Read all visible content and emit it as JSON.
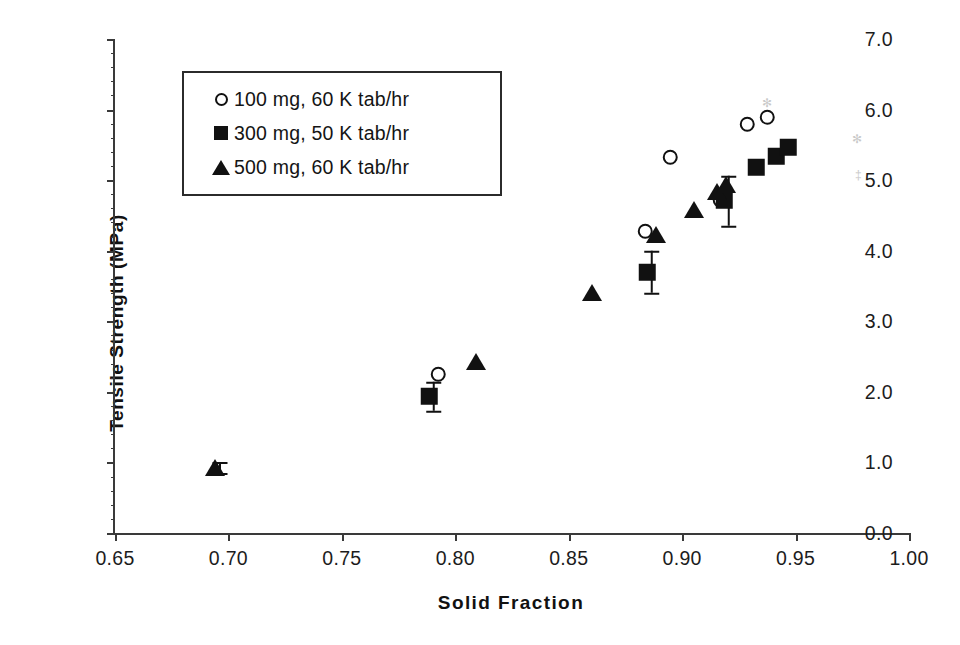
{
  "chart_data": {
    "type": "scatter",
    "title": "",
    "xlabel": "Solid Fraction",
    "ylabel": "Tensile Strength (MPa)",
    "xlim": [
      0.65,
      1.0
    ],
    "ylim": [
      0.0,
      7.0
    ],
    "xticks": [
      "0.65",
      "0.70",
      "0.75",
      "0.80",
      "0.85",
      "0.90",
      "0.95",
      "1.00"
    ],
    "xtick_values": [
      0.65,
      0.7,
      0.75,
      0.8,
      0.85,
      0.9,
      0.95,
      1.0
    ],
    "yticks": [
      "0.0",
      "1.0",
      "2.0",
      "3.0",
      "4.0",
      "5.0",
      "6.0",
      "7.0"
    ],
    "ytick_values": [
      0.0,
      1.0,
      2.0,
      3.0,
      4.0,
      5.0,
      6.0,
      7.0
    ],
    "grid": false,
    "legend_position": "upper-left-inside",
    "series": [
      {
        "name": "100 mg, 60 K tab/hr",
        "marker": "open-circle",
        "color": "#111111",
        "points": [
          {
            "x": 0.7945,
            "y": 2.19
          },
          {
            "x": 0.8855,
            "y": 4.22
          },
          {
            "x": 0.8965,
            "y": 5.26
          },
          {
            "x": 0.9185,
            "y": 4.66
          },
          {
            "x": 0.9305,
            "y": 5.73
          },
          {
            "x": 0.9395,
            "y": 5.83
          }
        ]
      },
      {
        "name": "300 mg, 50 K tab/hr",
        "marker": "filled-square",
        "color": "#111111",
        "points": [
          {
            "x": 0.7905,
            "y": 1.88,
            "yerr": 0.21
          },
          {
            "x": 0.8865,
            "y": 3.64,
            "yerr": 0.3
          },
          {
            "x": 0.9205,
            "y": 4.65,
            "yerr": 0.35
          },
          {
            "x": 0.9345,
            "y": 5.12
          },
          {
            "x": 0.9435,
            "y": 5.28
          },
          {
            "x": 0.9485,
            "y": 5.4
          }
        ]
      },
      {
        "name": "500 mg, 60 K tab/hr",
        "marker": "filled-triangle",
        "color": "#111111",
        "points": [
          {
            "x": 0.6965,
            "y": 0.87,
            "yerr": 0.08
          },
          {
            "x": 0.8115,
            "y": 2.37
          },
          {
            "x": 0.8625,
            "y": 3.35
          },
          {
            "x": 0.8905,
            "y": 4.17
          },
          {
            "x": 0.9075,
            "y": 4.52
          },
          {
            "x": 0.9175,
            "y": 4.78
          },
          {
            "x": 0.9215,
            "y": 4.88
          }
        ]
      }
    ]
  },
  "legend": {
    "items": [
      {
        "symbol": "open-circle",
        "label": "100 mg, 60 K tab/hr"
      },
      {
        "symbol": "filled-square",
        "label": "300 mg, 50 K tab/hr"
      },
      {
        "symbol": "filled-triangle",
        "label": "500 mg, 60 K tab/hr"
      }
    ]
  }
}
